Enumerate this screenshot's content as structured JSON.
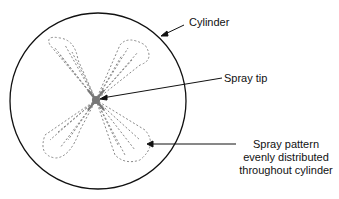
{
  "diagram": {
    "labels": {
      "cylinder": "Cylinder",
      "spray_tip": "Spray tip",
      "spray_pattern": [
        "Spray pattern",
        "evenly distributed",
        "throughout cylinder"
      ]
    },
    "colors": {
      "outline": "#111111",
      "spray": "#808080"
    }
  }
}
